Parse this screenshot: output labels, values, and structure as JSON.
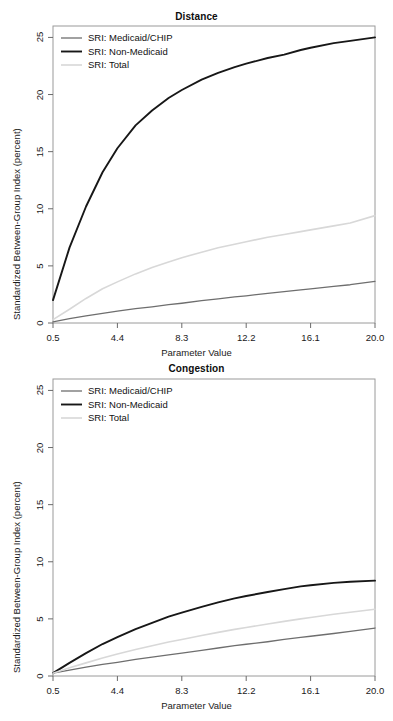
{
  "figure": {
    "background": "#ffffff",
    "panel_count": 2
  },
  "axis": {
    "xlabel": "Parameter Value",
    "ylabel": "Standardized Between-Group Index (percent)",
    "xticks": [
      "0.5",
      "4.4",
      "8.3",
      "12.2",
      "16.1",
      "20.0"
    ],
    "yticks": [
      "0",
      "5",
      "10",
      "15",
      "20",
      "25"
    ]
  },
  "legend": {
    "entries": [
      {
        "label": "SRI: Medicaid/CHIP",
        "color": "#6e6e6e",
        "width": 1.3
      },
      {
        "label": "SRI: Non-Medicaid",
        "color": "#171717",
        "width": 1.9
      },
      {
        "label": "SRI: Total",
        "color": "#d8d8d8",
        "width": 1.6
      }
    ]
  },
  "chart_data": [
    {
      "type": "line",
      "title": "Distance",
      "xlabel": "Parameter Value",
      "ylabel": "Standardized Between-Group Index (percent)",
      "xlim": [
        0.5,
        20.0
      ],
      "ylim": [
        0,
        26
      ],
      "xticks": [
        0.5,
        4.4,
        8.3,
        12.2,
        16.1,
        20.0
      ],
      "yticks": [
        0,
        5,
        10,
        15,
        20,
        25
      ],
      "grid": false,
      "legend_position": "top-left",
      "x": [
        0.5,
        1.5,
        2.5,
        3.5,
        4.4,
        5.5,
        6.5,
        7.5,
        8.3,
        9.5,
        10.5,
        11.5,
        12.2,
        13.5,
        14.5,
        15.5,
        16.1,
        17.5,
        18.5,
        20.0
      ],
      "series": [
        {
          "name": "SRI: Medicaid/CHIP",
          "color": "#6e6e6e",
          "values": [
            0.1,
            0.38,
            0.62,
            0.85,
            1.03,
            1.25,
            1.42,
            1.6,
            1.73,
            1.95,
            2.12,
            2.28,
            2.38,
            2.6,
            2.75,
            2.9,
            2.98,
            3.2,
            3.35,
            3.65
          ]
        },
        {
          "name": "SRI: Non-Medicaid",
          "color": "#171717",
          "values": [
            2.0,
            6.6,
            10.2,
            13.2,
            15.3,
            17.3,
            18.6,
            19.7,
            20.4,
            21.3,
            21.9,
            22.4,
            22.7,
            23.2,
            23.5,
            23.9,
            24.1,
            24.5,
            24.7,
            25.0
          ]
        },
        {
          "name": "SRI: Total",
          "color": "#d8d8d8",
          "values": [
            0.3,
            1.2,
            2.15,
            3.0,
            3.6,
            4.3,
            4.85,
            5.35,
            5.72,
            6.2,
            6.58,
            6.9,
            7.12,
            7.5,
            7.75,
            8.0,
            8.15,
            8.5,
            8.75,
            9.4
          ]
        }
      ]
    },
    {
      "type": "line",
      "title": "Congestion",
      "xlabel": "Parameter Value",
      "ylabel": "Standardized Between-Group Index (percent)",
      "xlim": [
        0.5,
        20.0
      ],
      "ylim": [
        0,
        26
      ],
      "xticks": [
        0.5,
        4.4,
        8.3,
        12.2,
        16.1,
        20.0
      ],
      "yticks": [
        0,
        5,
        10,
        15,
        20,
        25
      ],
      "grid": false,
      "legend_position": "top-left",
      "x": [
        0.5,
        1.5,
        2.5,
        3.5,
        4.4,
        5.5,
        6.5,
        7.5,
        8.3,
        9.5,
        10.5,
        11.5,
        12.2,
        13.5,
        14.5,
        15.5,
        16.1,
        17.5,
        18.5,
        20.0
      ],
      "series": [
        {
          "name": "SRI: Medicaid/CHIP",
          "color": "#6e6e6e",
          "values": [
            0.25,
            0.52,
            0.78,
            1.02,
            1.2,
            1.45,
            1.65,
            1.85,
            2.0,
            2.25,
            2.45,
            2.65,
            2.78,
            3.0,
            3.2,
            3.38,
            3.48,
            3.72,
            3.9,
            4.2
          ]
        },
        {
          "name": "SRI: Non-Medicaid",
          "color": "#171717",
          "values": [
            0.25,
            1.15,
            2.0,
            2.8,
            3.4,
            4.1,
            4.65,
            5.2,
            5.55,
            6.05,
            6.45,
            6.8,
            7.0,
            7.35,
            7.6,
            7.85,
            7.95,
            8.15,
            8.25,
            8.35
          ]
        },
        {
          "name": "SRI: Total",
          "color": "#d8d8d8",
          "values": [
            0.25,
            0.72,
            1.15,
            1.58,
            1.92,
            2.32,
            2.65,
            2.98,
            3.2,
            3.55,
            3.82,
            4.08,
            4.25,
            4.55,
            4.78,
            5.0,
            5.12,
            5.4,
            5.58,
            5.85
          ]
        }
      ]
    }
  ]
}
